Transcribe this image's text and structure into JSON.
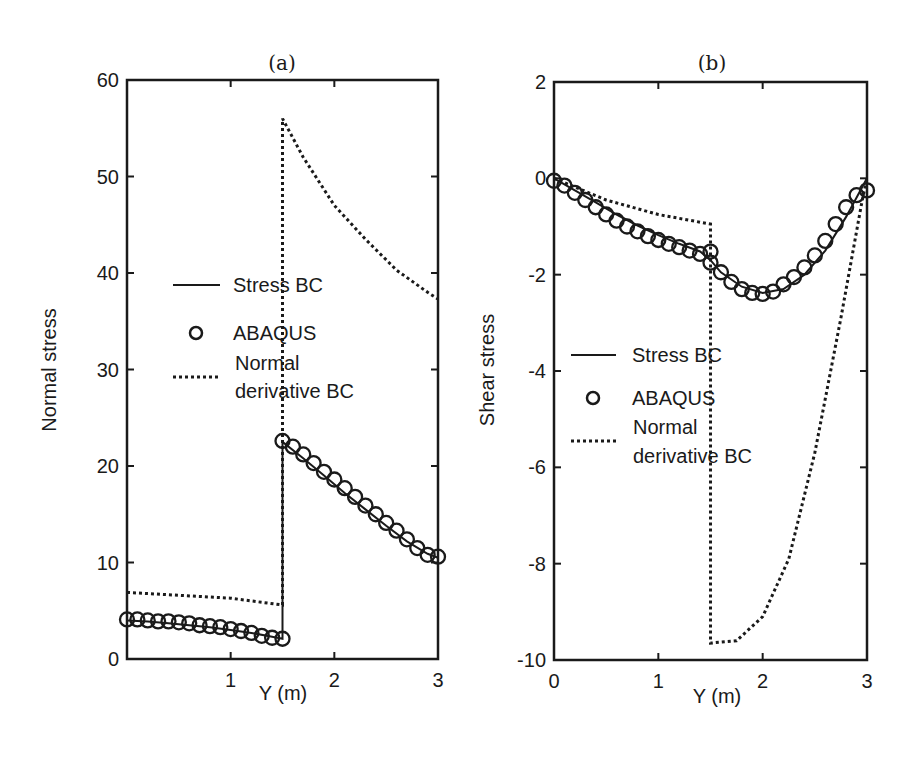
{
  "chart_data": [
    {
      "type": "line",
      "title": "(a)",
      "xlabel": "Y (m)",
      "ylabel": "Normal stress",
      "xlim": [
        0,
        3
      ],
      "ylim": [
        0,
        60
      ],
      "xticks": [
        "1",
        "2",
        "3"
      ],
      "yticks": [
        "0",
        "10",
        "20",
        "30",
        "40",
        "50",
        "60"
      ],
      "grid": false,
      "legend_position": "center-left",
      "legend": [
        "Stress BC",
        "ABAQUS",
        "Normal derivative BC"
      ],
      "series": [
        {
          "name": "Stress BC",
          "style": "solid",
          "x": [
            0,
            0.2,
            0.4,
            0.6,
            0.8,
            1.0,
            1.2,
            1.4,
            1.5,
            1.5,
            1.7,
            1.9,
            2.1,
            2.3,
            2.5,
            2.7,
            2.9,
            3.0
          ],
          "y": [
            4.0,
            3.9,
            3.7,
            3.5,
            3.3,
            3.0,
            2.7,
            2.3,
            2.1,
            22.5,
            20.8,
            19.0,
            17.2,
            15.5,
            13.8,
            12.2,
            10.9,
            10.5
          ]
        },
        {
          "name": "ABAQUS",
          "style": "circle",
          "x": [
            0,
            0.1,
            0.2,
            0.3,
            0.4,
            0.5,
            0.6,
            0.7,
            0.8,
            0.9,
            1.0,
            1.1,
            1.2,
            1.3,
            1.4,
            1.5,
            1.5,
            1.6,
            1.7,
            1.8,
            1.9,
            2.0,
            2.1,
            2.2,
            2.3,
            2.4,
            2.5,
            2.6,
            2.7,
            2.8,
            2.9,
            3.0
          ],
          "y": [
            4.1,
            4.1,
            4.0,
            3.9,
            3.9,
            3.8,
            3.7,
            3.5,
            3.4,
            3.3,
            3.1,
            2.9,
            2.7,
            2.4,
            2.2,
            2.1,
            22.6,
            22.0,
            21.2,
            20.3,
            19.4,
            18.6,
            17.7,
            16.8,
            15.9,
            15.0,
            14.1,
            13.3,
            12.4,
            11.5,
            10.8,
            10.6
          ]
        },
        {
          "name": "Normal derivative BC",
          "style": "dotted",
          "x": [
            0,
            0.5,
            1.0,
            1.5,
            1.5,
            1.7,
            2.0,
            2.3,
            2.6,
            2.9,
            3.0
          ],
          "y": [
            6.9,
            6.6,
            6.3,
            5.6,
            56.0,
            52.0,
            47.0,
            43.5,
            40.3,
            38.0,
            37.3
          ]
        }
      ]
    },
    {
      "type": "line",
      "title": "(b)",
      "xlabel": "Y (m)",
      "ylabel": "Shear stress",
      "xlim": [
        0,
        3
      ],
      "ylim": [
        -10,
        2
      ],
      "xticks": [
        "0",
        "1",
        "2",
        "3"
      ],
      "yticks": [
        "-10",
        "-8",
        "-6",
        "-4",
        "-2",
        "0",
        "2"
      ],
      "grid": false,
      "legend_position": "center-left",
      "legend": [
        "Stress BC",
        "ABAQUS",
        "Normal derivative BC"
      ],
      "series": [
        {
          "name": "Stress BC",
          "style": "solid",
          "x": [
            0,
            0.2,
            0.4,
            0.6,
            0.8,
            1.0,
            1.2,
            1.4,
            1.5,
            1.6,
            1.8,
            2.0,
            2.2,
            2.4,
            2.6,
            2.8,
            2.9,
            3.0
          ],
          "y": [
            0.0,
            -0.25,
            -0.5,
            -0.75,
            -0.98,
            -1.18,
            -1.36,
            -1.52,
            -1.7,
            -1.95,
            -2.25,
            -2.38,
            -2.3,
            -2.0,
            -1.5,
            -0.8,
            -0.4,
            0.0
          ],
          "note": "solid line closely follows the ABAQUS markers"
        },
        {
          "name": "ABAQUS",
          "style": "circle",
          "x": [
            0,
            0.1,
            0.2,
            0.3,
            0.4,
            0.5,
            0.6,
            0.7,
            0.8,
            0.9,
            1.0,
            1.1,
            1.2,
            1.3,
            1.4,
            1.5,
            1.5,
            1.6,
            1.7,
            1.8,
            1.9,
            2.0,
            2.1,
            2.2,
            2.3,
            2.4,
            2.5,
            2.6,
            2.7,
            2.8,
            2.9,
            3.0
          ],
          "y": [
            -0.05,
            -0.15,
            -0.3,
            -0.45,
            -0.6,
            -0.75,
            -0.88,
            -1.0,
            -1.1,
            -1.2,
            -1.28,
            -1.36,
            -1.43,
            -1.5,
            -1.57,
            -1.52,
            -1.75,
            -1.95,
            -2.15,
            -2.3,
            -2.38,
            -2.4,
            -2.35,
            -2.2,
            -2.05,
            -1.85,
            -1.6,
            -1.3,
            -0.95,
            -0.6,
            -0.35,
            -0.25
          ]
        },
        {
          "name": "Normal derivative BC",
          "style": "dotted",
          "x": [
            0,
            0.5,
            1.0,
            1.5,
            1.5,
            1.75,
            2.0,
            2.25,
            2.5,
            2.75,
            2.95,
            3.0
          ],
          "y": [
            0.0,
            -0.45,
            -0.75,
            -0.95,
            -9.65,
            -9.6,
            -9.1,
            -7.9,
            -5.7,
            -2.9,
            -0.5,
            0.0
          ]
        }
      ]
    }
  ],
  "panels": {
    "a": {
      "title": "(a)",
      "xlabel": "Y (m)",
      "ylabel": "Normal stress",
      "legend": {
        "stress_bc": "Stress BC",
        "abaqus": "ABAQUS",
        "normal_line1": "Normal",
        "normal_line2": "derivative BC"
      }
    },
    "b": {
      "title": "(b)",
      "xlabel": "Y (m)",
      "ylabel": "Shear stress",
      "legend": {
        "stress_bc": "Stress BC",
        "abaqus": "ABAQUS",
        "normal_line1": "Normal",
        "normal_line2": "derivative BC"
      }
    }
  },
  "colors": {
    "ink": "#1a1a1a",
    "background": "#ffffff"
  }
}
